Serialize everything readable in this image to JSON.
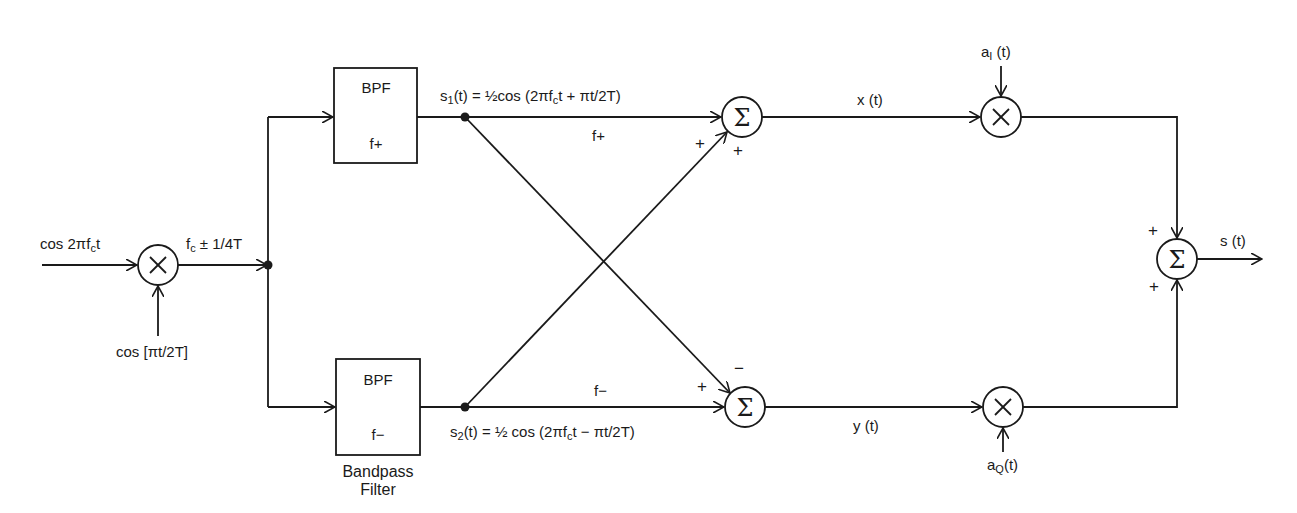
{
  "diagram": {
    "type": "block-diagram",
    "title": "",
    "inputs": {
      "carrier": "cos 2πfct",
      "carrier_sub": "c",
      "modulation": "cos [πt/2T]"
    },
    "mixer_output_label": "fc ± 1/4T",
    "filters": {
      "top": {
        "title": "BPF",
        "band": "f+"
      },
      "bottom": {
        "title": "BPF",
        "band": "f−",
        "caption_line1": "Bandpass",
        "caption_line2": "Filter"
      }
    },
    "signals": {
      "s1": "s₁(t) = ½cos (2πfct + πt/2T)",
      "s2": "s₂(t) = ½ cos (2πfct − πt/2T)",
      "top_path_label": "f+",
      "bottom_path_label": "f−",
      "x": "x (t)",
      "y": "y (t)",
      "aI": "aI (t)",
      "aQ": "aQ(t)",
      "output": "s (t)"
    },
    "summers": {
      "top": {
        "symbol": "Σ",
        "sign_left": "+",
        "sign_bottom": "+"
      },
      "bottom": {
        "symbol": "Σ",
        "sign_left": "+",
        "sign_top": "−"
      },
      "final": {
        "symbol": "Σ",
        "sign_top": "+",
        "sign_bottom": "+"
      }
    },
    "multiplier_symbol": "×",
    "nodes": [
      {
        "id": "mixer",
        "kind": "multiplier"
      },
      {
        "id": "bpf_plus",
        "kind": "filter",
        "label": "BPF f+"
      },
      {
        "id": "bpf_minus",
        "kind": "filter",
        "label": "BPF f−"
      },
      {
        "id": "sum_top",
        "kind": "summer"
      },
      {
        "id": "sum_bottom",
        "kind": "summer"
      },
      {
        "id": "mult_I",
        "kind": "multiplier"
      },
      {
        "id": "mult_Q",
        "kind": "multiplier"
      },
      {
        "id": "sum_out",
        "kind": "summer"
      }
    ],
    "edges": [
      {
        "from": "input",
        "to": "mixer",
        "label": "cos 2πfct"
      },
      {
        "from": "cos [πt/2T]",
        "to": "mixer"
      },
      {
        "from": "mixer",
        "to": "bpf_plus",
        "label": "fc ± 1/4T"
      },
      {
        "from": "mixer",
        "to": "bpf_minus"
      },
      {
        "from": "bpf_plus",
        "to": "sum_top",
        "label": "f+",
        "sign": "+"
      },
      {
        "from": "bpf_plus",
        "to": "sum_bottom",
        "sign": "−"
      },
      {
        "from": "bpf_minus",
        "to": "sum_top",
        "sign": "+"
      },
      {
        "from": "bpf_minus",
        "to": "sum_bottom",
        "label": "f−",
        "sign": "+"
      },
      {
        "from": "sum_top",
        "to": "mult_I",
        "label": "x (t)"
      },
      {
        "from": "aI (t)",
        "to": "mult_I"
      },
      {
        "from": "sum_bottom",
        "to": "mult_Q",
        "label": "y (t)"
      },
      {
        "from": "aQ(t)",
        "to": "mult_Q"
      },
      {
        "from": "mult_I",
        "to": "sum_out",
        "sign": "+"
      },
      {
        "from": "mult_Q",
        "to": "sum_out",
        "sign": "+"
      },
      {
        "from": "sum_out",
        "to": "output",
        "label": "s (t)"
      }
    ]
  }
}
